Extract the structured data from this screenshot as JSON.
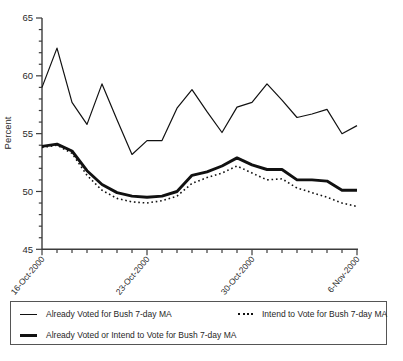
{
  "colors": {
    "line": "#111111",
    "axis": "#3c3c3c",
    "tick_text": "#2a2a2a",
    "legend_border": "#555555",
    "background": "#ffffff"
  },
  "chart_data": {
    "type": "line",
    "title": "",
    "xlabel": "",
    "ylabel": "Percent",
    "ylim": [
      45,
      65
    ],
    "y_major_ticks": [
      45,
      50,
      55,
      60,
      65
    ],
    "y_minor_step": 1,
    "grid": "off",
    "legend_position": "bottom-box",
    "x": [
      "16-Oct-2000",
      "17-Oct-2000",
      "18-Oct-2000",
      "19-Oct-2000",
      "20-Oct-2000",
      "21-Oct-2000",
      "22-Oct-2000",
      "23-Oct-2000",
      "24-Oct-2000",
      "25-Oct-2000",
      "26-Oct-2000",
      "27-Oct-2000",
      "28-Oct-2000",
      "29-Oct-2000",
      "30-Oct-2000",
      "31-Oct-2000",
      "1-Nov-2000",
      "2-Nov-2000",
      "3-Nov-2000",
      "4-Nov-2000",
      "5-Nov-2000",
      "6-Nov-2000"
    ],
    "x_major_tick_indices": [
      0,
      7,
      14,
      21
    ],
    "x_major_tick_labels": [
      "16-Oct-2000",
      "23-Oct-2000",
      "30-Oct-2000",
      "6-Nov-2000"
    ],
    "series": [
      {
        "name": "Already Voted for Bush 7-day MA",
        "style": "thin-solid",
        "values": [
          59.0,
          62.4,
          57.7,
          55.8,
          59.3,
          56.2,
          53.2,
          54.4,
          54.4,
          57.2,
          58.8,
          56.9,
          55.1,
          57.3,
          57.7,
          59.3,
          57.9,
          56.4,
          56.7,
          57.1,
          55.0,
          55.7
        ]
      },
      {
        "name": "Intend to Vote for Bush 7-day MA",
        "style": "dotted",
        "values": [
          53.8,
          54.0,
          53.3,
          51.4,
          50.1,
          49.4,
          49.1,
          49.0,
          49.2,
          49.6,
          50.7,
          51.2,
          51.6,
          52.2,
          51.6,
          51.0,
          51.1,
          50.3,
          49.9,
          49.5,
          49.0,
          48.7
        ]
      },
      {
        "name": "Already Voted or Intend to Vote for Bush 7-day MA",
        "style": "thick-solid",
        "values": [
          53.9,
          54.1,
          53.5,
          51.8,
          50.6,
          49.9,
          49.6,
          49.5,
          49.6,
          50.0,
          51.4,
          51.7,
          52.2,
          52.9,
          52.3,
          51.9,
          51.9,
          51.0,
          51.0,
          50.9,
          50.1,
          50.1
        ]
      }
    ]
  },
  "legend": {
    "items": [
      {
        "sample": "thin-solid"
      },
      {
        "sample": "dotted"
      },
      {
        "sample": "thick-solid"
      }
    ]
  }
}
